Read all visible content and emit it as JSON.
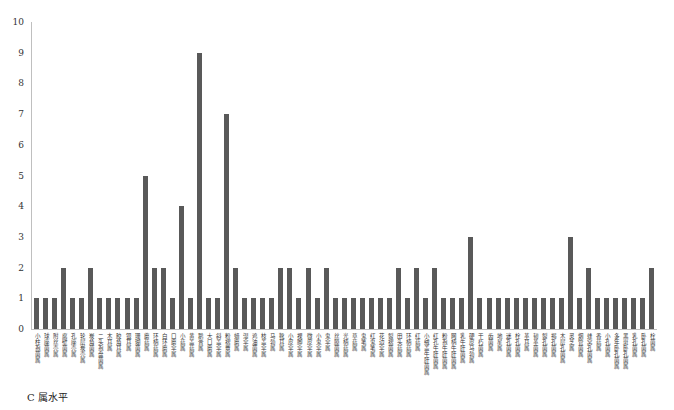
{
  "caption": "C 属水平",
  "chart_data": {
    "type": "bar",
    "title": "",
    "xlabel": "",
    "ylabel": "",
    "ylim": [
      0,
      10
    ],
    "yticks": [
      0,
      1,
      2,
      3,
      4,
      5,
      6,
      7,
      8,
      9,
      10
    ],
    "grid": false,
    "legend": null,
    "bar_color": "#595959",
    "categories": [
      "小柱孢菌属",
      "球座菌属",
      "附丝壳属",
      "腐壁菌属",
      "孔座壳属",
      "轮层炭壳属",
      "炭角菌属",
      "二头孢盘菌属",
      "木耳属",
      "胶角耳属",
      "银耳属",
      "珊瑚菌属",
      "蘑菇属",
      "环柄菇属",
      "白环蘑属",
      "口蘑伞属",
      "小菇属",
      "黄盖菇属",
      "鹅膏属",
      "大口蘑属",
      "斜盖伞属",
      "粉褶蕈属",
      "蜡蘑属",
      "湿伞属",
      "鸡油菌属",
      "枝盖伞属",
      "马勃属",
      "靴耳属",
      "小皮伞属",
      "裸脚伞属",
      "微皮伞属",
      "小鬼伞属",
      "鬼伞属",
      "丝膜菌属",
      "光柄菇属",
      "草菇属",
      "鬼笔属",
      "红鬼笔属",
      "花边伞属",
      "裂褶菌属",
      "田头菇属",
      "环柄菇属",
      "红菇属",
      "小绒盖牛肝菌属",
      "红孔牛肝菌属",
      "粉孢牛肝菌属",
      "网柄牛肝菌属",
      "乳牛肝菌属",
      "硬皮马勃属",
      "干朽菌属",
      "齿菌属",
      "地星属",
      "迷孔菌属",
      "栓孔菌属",
      "革耳属",
      "韧革菌属",
      "裂孔菌属",
      "褐孔菌属",
      "木层孔菌属",
      "灵芝属",
      "烟管菌属",
      "蜂窝孔菌属",
      "香菇属",
      "小孔菌属",
      "多年卧孔菌属",
      "黑斑卧孔菌属",
      "乳孔菌属",
      "卧孔菌属",
      "栓菌属"
    ],
    "values": [
      1,
      1,
      1,
      2,
      1,
      1,
      2,
      1,
      1,
      1,
      1,
      1,
      5,
      2,
      2,
      1,
      4,
      1,
      9,
      1,
      1,
      7,
      2,
      1,
      1,
      1,
      1,
      2,
      2,
      1,
      2,
      1,
      2,
      1,
      1,
      1,
      1,
      1,
      1,
      1,
      2,
      1,
      2,
      1,
      2,
      1,
      1,
      1,
      3,
      1,
      1,
      1,
      1,
      1,
      1,
      1,
      1,
      1,
      1,
      3,
      1,
      2,
      1,
      1,
      1,
      1,
      1,
      1,
      2
    ]
  }
}
